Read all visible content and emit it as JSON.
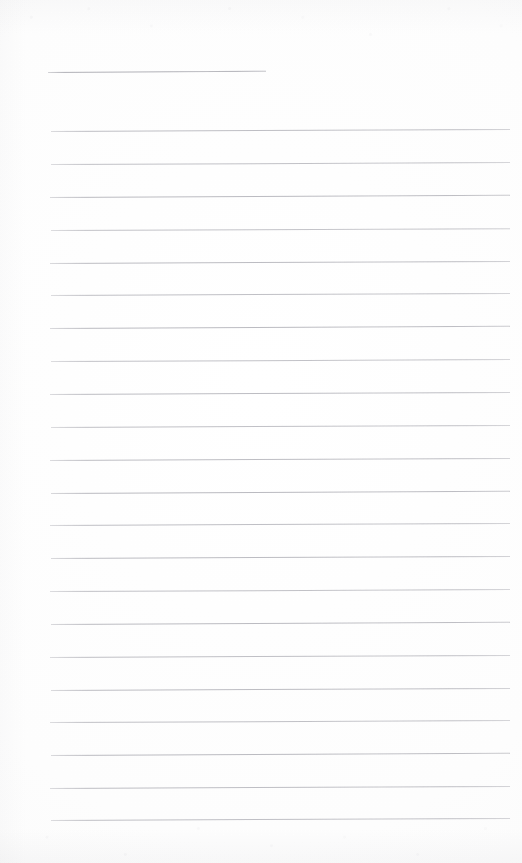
{
  "document": {
    "type": "lined-notepad-page",
    "title": "Blank ruled notepad sheet",
    "content_text": "",
    "page_width": 522,
    "page_height": 863,
    "background_color": "#fefefe",
    "rule_color": "#b9b9bf",
    "header_rule_color": "#a9a9b0",
    "paper_texture": "faint scan grain along top and bottom edges"
  },
  "layout": {
    "left_margin_x": 50,
    "right_edge_x": 510,
    "line_spacing": 32.8,
    "first_full_line_y": 131,
    "last_full_line_y": 820,
    "full_line_count": 22,
    "skew_degrees": -0.25
  },
  "header_rule": {
    "label": "title-rule",
    "x": 48,
    "y": 72,
    "width": 218,
    "skew_degrees": -0.35,
    "opacity": 0.9
  },
  "rules": [
    {
      "index": 1,
      "y": 131,
      "x": 51,
      "width": 459,
      "opacity": 0.92,
      "skew_degrees": -0.26
    },
    {
      "index": 2,
      "y": 164,
      "x": 51,
      "width": 459,
      "opacity": 0.88,
      "skew_degrees": -0.24
    },
    {
      "index": 3,
      "y": 197,
      "x": 50,
      "width": 460,
      "opacity": 0.97,
      "skew_degrees": -0.27
    },
    {
      "index": 4,
      "y": 230,
      "x": 51,
      "width": 459,
      "opacity": 0.86,
      "skew_degrees": -0.23
    },
    {
      "index": 5,
      "y": 263,
      "x": 50,
      "width": 460,
      "opacity": 0.95,
      "skew_degrees": -0.26
    },
    {
      "index": 6,
      "y": 295,
      "x": 51,
      "width": 459,
      "opacity": 0.9,
      "skew_degrees": -0.25
    },
    {
      "index": 7,
      "y": 328,
      "x": 50,
      "width": 460,
      "opacity": 0.96,
      "skew_degrees": -0.27
    },
    {
      "index": 8,
      "y": 361,
      "x": 51,
      "width": 459,
      "opacity": 0.87,
      "skew_degrees": -0.24
    },
    {
      "index": 9,
      "y": 394,
      "x": 50,
      "width": 460,
      "opacity": 0.94,
      "skew_degrees": -0.26
    },
    {
      "index": 10,
      "y": 427,
      "x": 51,
      "width": 459,
      "opacity": 0.89,
      "skew_degrees": -0.25
    },
    {
      "index": 11,
      "y": 460,
      "x": 50,
      "width": 460,
      "opacity": 0.93,
      "skew_degrees": -0.26
    },
    {
      "index": 12,
      "y": 493,
      "x": 51,
      "width": 459,
      "opacity": 0.98,
      "skew_degrees": -0.27
    },
    {
      "index": 13,
      "y": 525,
      "x": 50,
      "width": 460,
      "opacity": 0.91,
      "skew_degrees": -0.25
    },
    {
      "index": 14,
      "y": 558,
      "x": 51,
      "width": 459,
      "opacity": 0.95,
      "skew_degrees": -0.26
    },
    {
      "index": 15,
      "y": 591,
      "x": 50,
      "width": 460,
      "opacity": 0.88,
      "skew_degrees": -0.24
    },
    {
      "index": 16,
      "y": 624,
      "x": 51,
      "width": 459,
      "opacity": 0.96,
      "skew_degrees": -0.27
    },
    {
      "index": 17,
      "y": 657,
      "x": 50,
      "width": 460,
      "opacity": 0.9,
      "skew_degrees": -0.25
    },
    {
      "index": 18,
      "y": 690,
      "x": 51,
      "width": 459,
      "opacity": 0.94,
      "skew_degrees": -0.26
    },
    {
      "index": 19,
      "y": 722,
      "x": 50,
      "width": 460,
      "opacity": 0.89,
      "skew_degrees": -0.24
    },
    {
      "index": 20,
      "y": 755,
      "x": 51,
      "width": 459,
      "opacity": 0.97,
      "skew_degrees": -0.27
    },
    {
      "index": 21,
      "y": 788,
      "x": 50,
      "width": 460,
      "opacity": 0.92,
      "skew_degrees": -0.25
    },
    {
      "index": 22,
      "y": 820,
      "x": 51,
      "width": 459,
      "opacity": 0.9,
      "skew_degrees": -0.26
    }
  ]
}
